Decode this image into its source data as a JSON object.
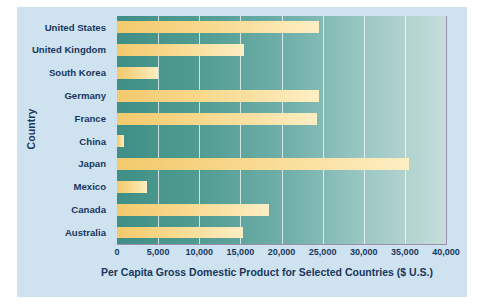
{
  "chart_data": {
    "type": "bar",
    "orientation": "horizontal",
    "title": "",
    "xlabel": "Per Capita Gross Domestic Product for Selected Countries ($ U.S.)",
    "ylabel": "Country",
    "categories": [
      "United States",
      "United Kingdom",
      "South Korea",
      "Germany",
      "France",
      "China",
      "Japan",
      "Mexico",
      "Canada",
      "Australia"
    ],
    "values": [
      24500,
      15500,
      5000,
      24500,
      24300,
      800,
      35500,
      3700,
      18500,
      15300
    ],
    "xlim": [
      0,
      40000
    ],
    "ylim": null,
    "xticks": [
      0,
      5000,
      10000,
      15000,
      20000,
      25000,
      30000,
      35000,
      40000
    ],
    "xtick_labels": [
      "0",
      "5,000",
      "10,000",
      "15,000",
      "20,000",
      "25,000",
      "30,000",
      "35,000",
      "40,000"
    ],
    "grid": "vertical",
    "legend": null,
    "colors": {
      "bar_start": "#f3c96c",
      "bar_end": "#fdeec3",
      "plot_bg_start": "#3f8f86",
      "plot_bg_end": "#c6ded9",
      "card_bg": "#cfe2f0",
      "text": "#17375e",
      "grid_line": "#ffffff",
      "axis_border": "#9a8fb3"
    }
  }
}
